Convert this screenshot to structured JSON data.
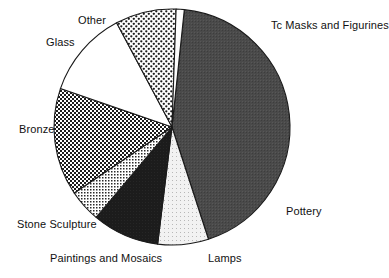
{
  "figure": {
    "type": "pie-chart-figure",
    "background_color": "#ffffff",
    "outline_color": "#1a1a1a"
  },
  "chart_data": {
    "type": "pie",
    "title": "",
    "subtitle": "",
    "xlabel": "",
    "ylabel": "",
    "legend_position": "none",
    "labels_position": "outside",
    "grid": false,
    "start_angle_deg": -84,
    "direction": "clockwise",
    "center": {
      "x": 172,
      "y": 127
    },
    "radius": 118,
    "categories": [
      "Tc Masks and Figurines",
      "Pottery",
      "Lamps",
      "Paintings and Mosaics",
      "Stone Sculpture",
      "Bronze",
      "Glass",
      "Other"
    ],
    "values": [
      43.3,
      7.0,
      9.2,
      4.4,
      14.7,
      11.9,
      8.3,
      1.2
    ],
    "angles_deg": [
      156.0,
      25.0,
      33.0,
      16.0,
      53.0,
      43.0,
      30.0,
      4.0
    ],
    "slices": [
      {
        "label": "Tc Masks and Figurines",
        "value": 43.3,
        "angle_deg": 156.0,
        "fill_name": "dark-gray-solid",
        "fill_color": "#474747",
        "label_x": 271,
        "label_y": 20,
        "label_align": "left"
      },
      {
        "label": "Pottery",
        "value": 7.0,
        "angle_deg": 25.0,
        "fill_name": "very-light-stipple",
        "fill_color": "#ebebeb",
        "label_x": 286,
        "label_y": 206,
        "label_align": "left"
      },
      {
        "label": "Lamps",
        "value": 9.2,
        "angle_deg": 33.0,
        "fill_name": "black-solid",
        "fill_color": "#1c1c1c",
        "label_x": 208,
        "label_y": 253,
        "label_align": "left"
      },
      {
        "label": "Paintings and Mosaics",
        "value": 4.4,
        "angle_deg": 16.0,
        "fill_name": "fine-light-checker",
        "fill_color": "#d9d9d9",
        "label_x": 50,
        "label_y": 253,
        "label_align": "left"
      },
      {
        "label": "Stone Sculpture",
        "value": 14.7,
        "angle_deg": 53.0,
        "fill_name": "dense-dark-checker",
        "fill_color": "#5a5a5a",
        "label_x": 17,
        "label_y": 219,
        "label_align": "left"
      },
      {
        "label": "Bronze",
        "value": 11.9,
        "angle_deg": 43.0,
        "fill_name": "white-solid",
        "fill_color": "#ffffff",
        "label_x": 19,
        "label_y": 124,
        "label_align": "left"
      },
      {
        "label": "Glass",
        "value": 8.3,
        "angle_deg": 30.0,
        "fill_name": "open-dot-checker",
        "fill_color": "#cfcfcf",
        "label_x": 46,
        "label_y": 37,
        "label_align": "left"
      },
      {
        "label": "Other",
        "value": 1.2,
        "angle_deg": 4.0,
        "fill_name": "white-sliver",
        "fill_color": "#ffffff",
        "label_x": 78,
        "label_y": 15,
        "label_align": "left"
      }
    ]
  }
}
